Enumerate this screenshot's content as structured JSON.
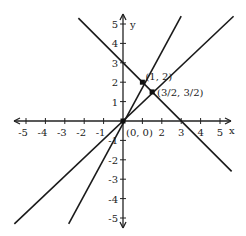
{
  "chart_data": {
    "type": "line",
    "title": "",
    "xlabel": "x",
    "ylabel": "y",
    "xlim": [
      -5.5,
      5.5
    ],
    "ylim": [
      -5.5,
      5.5
    ],
    "grid": false,
    "x_ticks": [
      -5,
      -4,
      -3,
      -2,
      -1,
      1,
      2,
      3,
      4,
      5
    ],
    "y_ticks": [
      -5,
      -4,
      -3,
      -2,
      -1,
      1,
      2,
      3,
      4,
      5
    ],
    "x_tick_labels": [
      "-5",
      "-4",
      "-3",
      "-2",
      "-1",
      "",
      "2",
      "3",
      "4",
      "5"
    ],
    "y_tick_labels": [
      "-5",
      "-4",
      "-3",
      "-2",
      "-1",
      "1",
      "2",
      "3",
      "4",
      "5"
    ],
    "series": [
      {
        "name": "y = -x + 3",
        "x": [
          -2.3,
          5.6
        ],
        "y": [
          5.3,
          -2.6
        ]
      },
      {
        "name": "y = x",
        "x": [
          -5.6,
          5.7
        ],
        "y": [
          -5.3,
          5.4
        ]
      },
      {
        "name": "y = 2x",
        "x": [
          -2.8,
          3.0
        ],
        "y": [
          -5.3,
          5.4
        ]
      }
    ],
    "points": [
      {
        "label": "(1, 2)",
        "x": 1,
        "y": 2
      },
      {
        "label": "(3/2, 3/2)",
        "x": 1.5,
        "y": 1.5
      },
      {
        "label": "(0, 0)",
        "x": 0,
        "y": 0
      }
    ]
  },
  "labels": {
    "x_axis": "x",
    "y_axis": "y",
    "point_a": "(1, 2)",
    "point_b": "(3/2, 3/2)",
    "origin": "(0, 0)"
  }
}
